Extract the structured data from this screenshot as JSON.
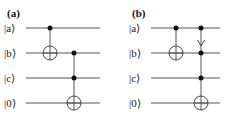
{
  "panels": [
    {
      "label": "(a)",
      "qubits": [
        {
          "name": "a",
          "ket": "|a⟩"
        },
        {
          "name": "b",
          "ket": "|b⟩"
        },
        {
          "name": "c",
          "ket": "|c⟩"
        },
        {
          "name": "0",
          "ket": "|0⟩"
        }
      ],
      "gates": [
        {
          "type": "CNOT",
          "controls": [
            "a"
          ],
          "target": "b"
        },
        {
          "type": "Toffoli",
          "controls": [
            "b",
            "c"
          ],
          "target": "0"
        }
      ]
    },
    {
      "label": "(b)",
      "qubits": [
        {
          "name": "a",
          "ket": "|a⟩"
        },
        {
          "name": "b",
          "ket": "|b⟩"
        },
        {
          "name": "c",
          "ket": "|c⟩"
        },
        {
          "name": "0",
          "ket": "|0⟩"
        }
      ],
      "gates": [
        {
          "type": "CNOT",
          "controls": [
            "a"
          ],
          "target": "b"
        },
        {
          "type": "Toffoli",
          "controls": [
            "a",
            "b",
            "c"
          ],
          "target": "0",
          "annotation": "arrow from a down to b"
        }
      ]
    }
  ]
}
